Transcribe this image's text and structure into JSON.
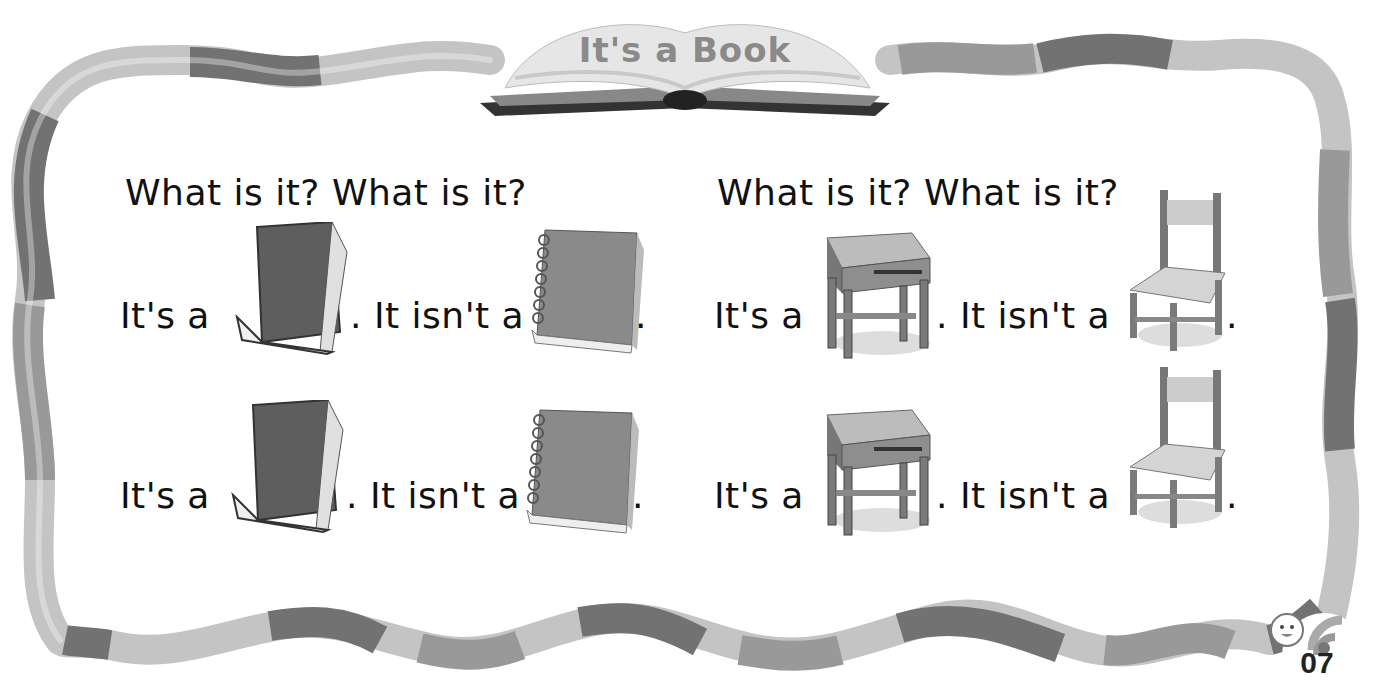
{
  "title": "It's a Book",
  "page_number": "07",
  "left_column": {
    "question": "What is it? What is it?",
    "rows": [
      {
        "prefix": "It's a",
        "middle": ". It isn't a",
        "suffix": ".",
        "is_item": "book",
        "isnt_item": "notebook"
      },
      {
        "prefix": "It's a",
        "middle": ". It isn't a",
        "suffix": ".",
        "is_item": "book",
        "isnt_item": "notebook"
      }
    ]
  },
  "right_column": {
    "question": "What is it? What is it?",
    "rows": [
      {
        "prefix": "It's a",
        "middle": ". It isn't a",
        "suffix": ".",
        "is_item": "desk",
        "isnt_item": "chair"
      },
      {
        "prefix": "It's a",
        "middle": ". It isn't a",
        "suffix": ".",
        "is_item": "desk",
        "isnt_item": "chair"
      }
    ]
  },
  "icons": {
    "title_banner": "open-book-icon",
    "audio": "audio-wave-icon",
    "mascot": "smiling-face-icon"
  },
  "colors": {
    "frame_dark": "#6e6e6e",
    "frame_mid": "#9b9b9b",
    "frame_light": "#c8c8c8",
    "text": "#111111",
    "title_text": "#8a8a8a"
  }
}
